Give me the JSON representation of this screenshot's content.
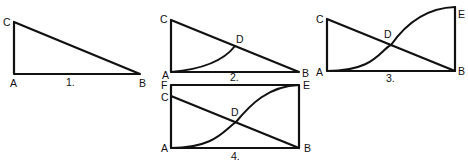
{
  "figures": [
    {
      "id": "1",
      "caption": "1.",
      "points": {
        "A": "A",
        "B": "B",
        "C": "C"
      },
      "description": "Right triangle ABC with vertical side AC and hypotenuse CB"
    },
    {
      "id": "2",
      "caption": "2.",
      "points": {
        "A": "A",
        "B": "B",
        "C": "C",
        "D": "D"
      },
      "description": "Triangle ABC with concave-up curve from A meeting hypotenuse CB at D"
    },
    {
      "id": "3",
      "caption": "3.",
      "points": {
        "A": "A",
        "B": "B",
        "C": "C",
        "D": "D",
        "E": "E"
      },
      "description": "Triangle ABC with vertical side BE and S-curve from A to E crossing CB at D"
    },
    {
      "id": "4",
      "caption": "4.",
      "points": {
        "A": "A",
        "B": "B",
        "C": "C",
        "D": "D",
        "E": "E",
        "F": "F"
      },
      "description": "Rectangle AFEB with diagonal line CB and S-curve from A to E crossing at D"
    }
  ],
  "colors": {
    "stroke": "#111111",
    "background": "#ffffff"
  }
}
